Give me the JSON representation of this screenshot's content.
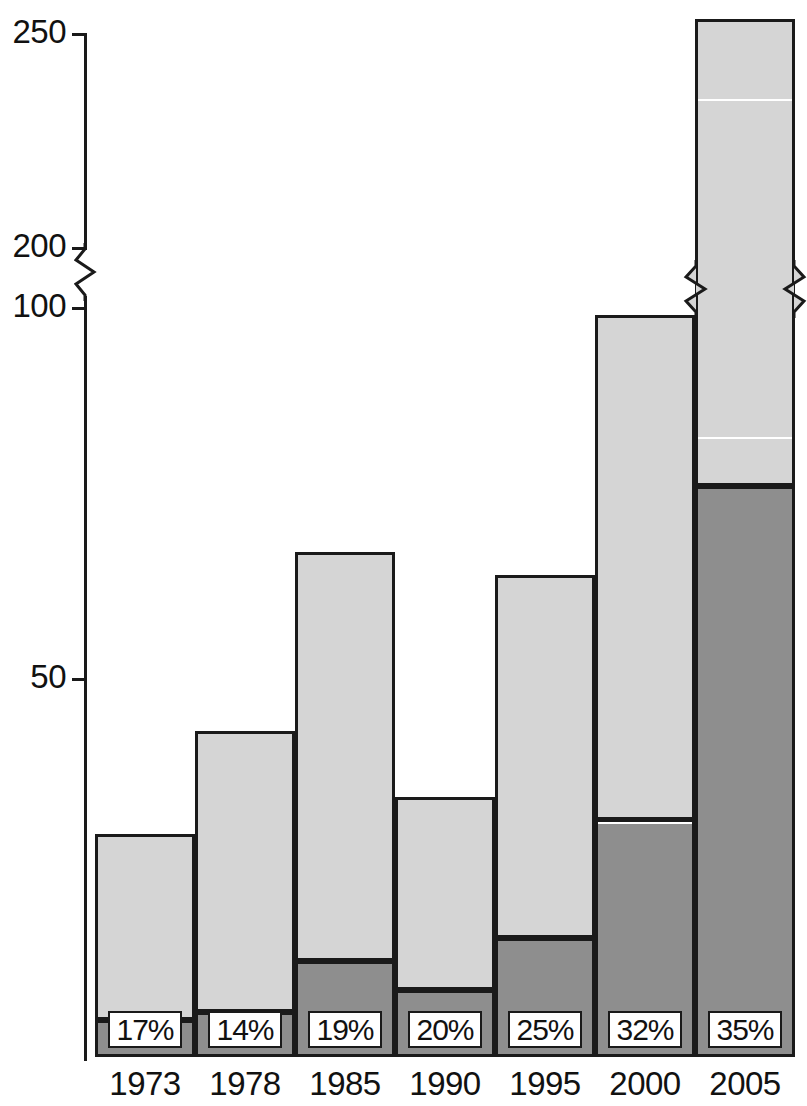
{
  "chart_data": {
    "type": "bar",
    "subtype": "stacked-bar",
    "title": "",
    "xlabel": "",
    "ylabel": "",
    "grid": false,
    "legend_position": "none",
    "axis_break": {
      "present": true,
      "between": [
        100,
        200
      ],
      "style": "zigzag"
    },
    "yticks": [
      "250",
      "200",
      "100",
      "50"
    ],
    "ytick_values": [
      250,
      200,
      100,
      50
    ],
    "ylim": [
      0,
      250
    ],
    "categories": [
      "1973",
      "1978",
      "1985",
      "1990",
      "1995",
      "2000",
      "2005"
    ],
    "series": [
      {
        "name": "lower-dark-segment",
        "color": "#8e8e8e",
        "values": [
          5,
          6,
          13,
          9,
          16,
          32,
          77
        ]
      },
      {
        "name": "upper-light-segment",
        "color": "#d5d5d5",
        "values": [
          25,
          38,
          55,
          26,
          49,
          68,
          155
        ]
      }
    ],
    "totals": [
      30,
      44,
      68,
      35,
      65,
      100,
      232
    ],
    "annotations": {
      "name": "percent-share-labels",
      "values": [
        "17%",
        "14%",
        "19%",
        "20%",
        "25%",
        "32%",
        "35%"
      ]
    }
  },
  "colors": {
    "ink": "#1a1a1a",
    "light_fill": "#d5d5d5",
    "dark_fill": "#8e8e8e",
    "background": "#ffffff"
  }
}
